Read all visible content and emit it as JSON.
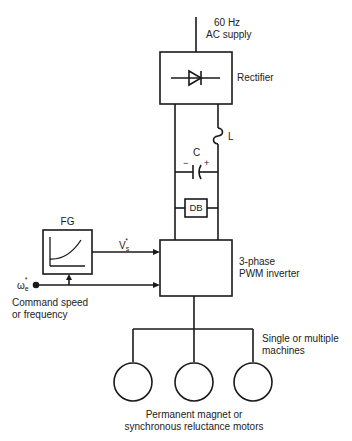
{
  "diagram": {
    "colors": {
      "line": "#1a1a1a",
      "text": "#222222",
      "background": "#ffffff"
    },
    "supply": {
      "line1": "60 Hz",
      "line2": "AC supply"
    },
    "rectifier": {
      "label": "Rectifier",
      "symbol": "diode-icon"
    },
    "inductor": {
      "label": "L"
    },
    "capacitor": {
      "label": "C",
      "minus": "−",
      "plus": "+"
    },
    "db": {
      "label": "DB"
    },
    "fg": {
      "label": "FG",
      "symbol": "v-f-curve-icon"
    },
    "vs_signal": {
      "symbol": "V",
      "subscript": "s",
      "superscript": "*"
    },
    "we_signal": {
      "symbol": "ω",
      "subscript": "e",
      "superscript": "*"
    },
    "command": {
      "line1": "Command speed",
      "line2": "or frequency"
    },
    "inverter": {
      "line1": "3-phase",
      "line2": "PWM inverter"
    },
    "machines": {
      "line1": "Single or multiple",
      "line2": "machines"
    },
    "motors": {
      "count": 3,
      "line1": "Permanent magnet or",
      "line2": "synchronous reluctance motors"
    }
  }
}
